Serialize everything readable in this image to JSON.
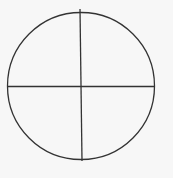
{
  "diagram": {
    "type": "circle-quadrants",
    "background": "#f7f7f7",
    "stroke_color": "#333333",
    "stroke_width": 1.3,
    "circle": {
      "cx": 81,
      "cy": 86,
      "r": 73.5
    },
    "vertical_divider": {
      "x1": 80,
      "y1": 9,
      "x2": 82,
      "y2": 161
    },
    "horizontal_divider": {
      "x1": 7.5,
      "y1": 86.5,
      "x2": 154.5,
      "y2": 86.5
    },
    "sections": 4
  }
}
